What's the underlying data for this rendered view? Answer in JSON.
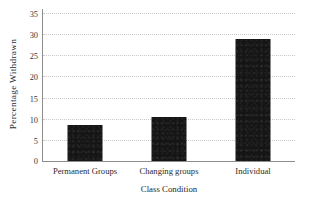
{
  "chart_data": {
    "type": "bar",
    "title": "",
    "subtitle": "",
    "xlabel": "Class Condition",
    "ylabel": "Percentage Withdrawn",
    "categories": [
      "Permanent Groups",
      "Changing groups",
      "Individual"
    ],
    "values": [
      8.6,
      10.5,
      28.8
    ],
    "ylim": [
      0,
      35
    ],
    "yticks": [
      0,
      5,
      10,
      15,
      20,
      25,
      30,
      35
    ],
    "ytick_labels": [
      "0",
      "5",
      "10",
      "15",
      "20",
      "25",
      "30",
      "35"
    ],
    "grid": "horizontal-dotted",
    "legend": "none",
    "annotations": [],
    "colors": {
      "bar": "#151515",
      "gridline": "#c9c9c9",
      "axis_line": "#8d8d8d",
      "text": "#2b2b2b",
      "background": "#ffffff"
    }
  }
}
